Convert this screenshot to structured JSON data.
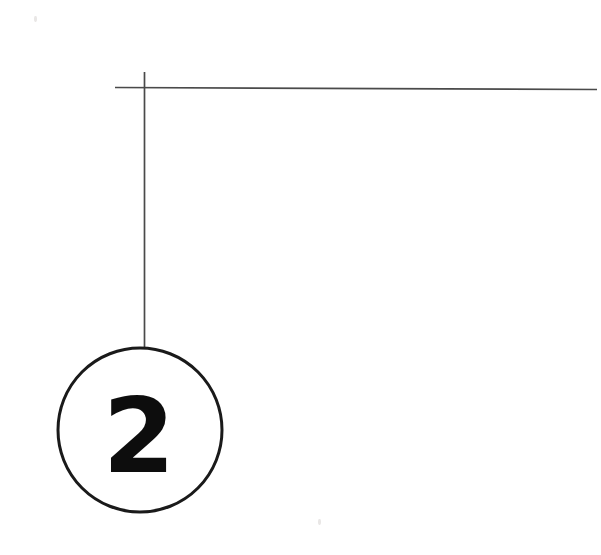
{
  "figure": {
    "type": "technical-drawing-callout",
    "background_color": "#ffffff",
    "ink_color": "#1a1a1a",
    "line_color": "#4d4d4d",
    "canvas": {
      "width": 601,
      "height": 555
    },
    "callout": {
      "label": "2",
      "label_color": "#0d0d0d",
      "circle": {
        "center_x": 140,
        "center_y": 430,
        "radius": 82,
        "stroke_width": 3,
        "stroke_color": "#1a1a1a",
        "fill": "none"
      },
      "label_position": {
        "x": 139,
        "y": 472
      }
    },
    "leader_lines": [
      {
        "name": "vertical-drop-line",
        "x1": 144.5,
        "y1": 72,
        "x2": 144.5,
        "y2": 348,
        "stroke_width": 1.7,
        "stroke_color": "#4a4a4a"
      },
      {
        "name": "horizontal-rule",
        "x1": 115,
        "y1": 87.5,
        "x2": 597,
        "y2": 89.5,
        "stroke_width": 1.7,
        "stroke_color": "#4a4a4a"
      }
    ],
    "intersection": {
      "x": 144.5,
      "y": 88
    },
    "artifacts": [
      {
        "name": "scan-speck-top-left",
        "x": 34,
        "y": 16,
        "width": 3,
        "height": 6
      },
      {
        "name": "scan-speck-lower-right",
        "x": 318,
        "y": 519,
        "width": 3,
        "height": 6
      }
    ]
  }
}
